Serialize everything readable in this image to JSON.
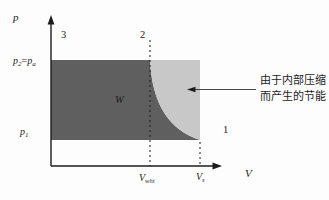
{
  "colors": {
    "dark_region": "#5f5f5f",
    "light_region": "#c8c8c8",
    "line": "#1c1c1c",
    "background": "#fdfdfd"
  },
  "diagram": {
    "y_axis_label": "p",
    "x_axis_label": "V",
    "point_labels": {
      "one": "1",
      "two": "2",
      "three": "3"
    },
    "work_label": "W",
    "p2_label": {
      "var": "p",
      "sub": "2",
      "equals": "=",
      "var2": "p",
      "sub2": "a"
    },
    "p1_label": {
      "var": "p",
      "sub": "1"
    },
    "v_internal_label": {
      "var": "V",
      "sub": "whi"
    },
    "v_suction_label": {
      "var": "V",
      "sub": "s"
    },
    "annotation": {
      "line1": "由于内部压缩",
      "line2": "而产生的节能"
    }
  }
}
